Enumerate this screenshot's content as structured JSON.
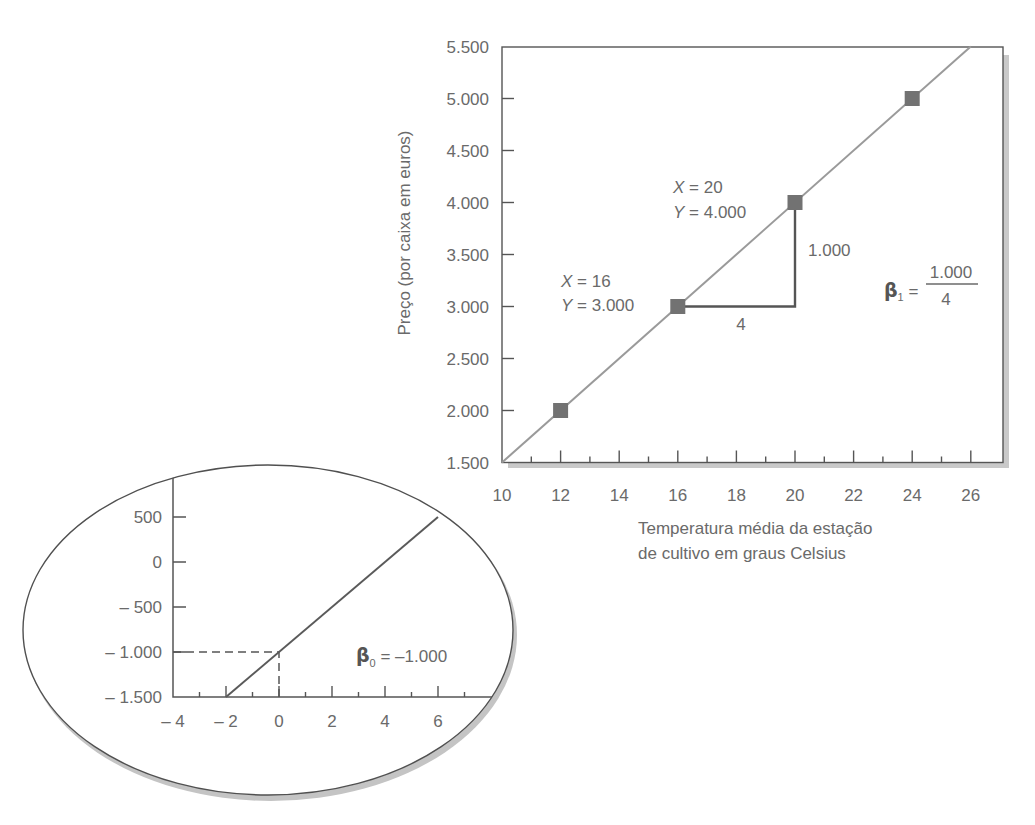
{
  "figure": {
    "main_chart": {
      "y_axis_title": "Preço (por caixa em euros)",
      "x_axis_title": [
        "Temperatura média da estação",
        "de cultivo em graus Celsius"
      ],
      "annotations": {
        "upper_point": {
          "x_var": "X",
          "x_eq": " = 20",
          "y_var": "Y",
          "y_eq": " = 4.000"
        },
        "lower_point": {
          "x_var": "X",
          "x_eq": " = 16",
          "y_var": "Y",
          "y_eq": " = 3.000"
        },
        "rise_label": "1.000",
        "run_label": "4",
        "slope": {
          "symbol": "β",
          "subscript": "1",
          "equals": " = ",
          "numerator": "1.000",
          "denominator": "4"
        }
      }
    },
    "inset_chart": {
      "intercept": {
        "symbol": "β",
        "subscript": "0",
        "equals": " = –1.000"
      }
    }
  },
  "chart_data": [
    {
      "type": "scatter",
      "title": "",
      "xlabel": "Temperatura média da estação de cultivo em graus Celsius",
      "ylabel": "Preço (por caixa em euros)",
      "xlim": [
        10,
        27
      ],
      "ylim": [
        1500,
        5500
      ],
      "grid": false,
      "x_ticks": [
        10,
        12,
        14,
        16,
        18,
        20,
        22,
        24,
        26
      ],
      "x_tick_labels": [
        "10",
        "12",
        "14",
        "16",
        "18",
        "20",
        "22",
        "24",
        "26"
      ],
      "minor_tick_step": 1,
      "y_ticks": [
        1500,
        2000,
        2500,
        3000,
        3500,
        4000,
        4500,
        5000,
        5500
      ],
      "y_tick_labels": [
        "1.500",
        "2.000",
        "2.500",
        "3.000",
        "3.500",
        "4.000",
        "4.500",
        "5.000",
        "5.500"
      ],
      "series": [
        {
          "name": "points",
          "type": "scatter",
          "x": [
            12,
            16,
            20,
            24
          ],
          "y": [
            2000,
            3000,
            4000,
            5000
          ]
        },
        {
          "name": "line",
          "type": "line",
          "x": [
            10,
            26
          ],
          "y": [
            1500,
            5500
          ],
          "equation": "Y = -1000 + 250X"
        }
      ],
      "slope_triangle": {
        "from": [
          16,
          3000
        ],
        "to": [
          20,
          4000
        ],
        "run": 4,
        "rise": 1000
      },
      "annotations": [
        "X = 20, Y = 4.000",
        "X = 16, Y = 3.000",
        "1.000",
        "4",
        "β1 = 1.000 / 4"
      ]
    },
    {
      "type": "line",
      "title": "",
      "xlim": [
        -4,
        7.5
      ],
      "ylim": [
        -1500,
        700
      ],
      "grid": false,
      "x_ticks": [
        -4,
        -2,
        0,
        2,
        4,
        6
      ],
      "x_tick_labels": [
        "– 4",
        "– 2",
        "0",
        "2",
        "4",
        "6"
      ],
      "minor_tick_step": 1,
      "y_ticks": [
        -1500,
        -1000,
        -500,
        0,
        500
      ],
      "y_tick_labels": [
        "– 1.500",
        "– 1.000",
        "– 500",
        "0",
        "500"
      ],
      "series": [
        {
          "name": "line",
          "type": "line",
          "x": [
            -2,
            6
          ],
          "y": [
            -1500,
            500
          ]
        }
      ],
      "reference_lines": [
        {
          "x": 0,
          "y": -1000,
          "style": "dashed"
        }
      ],
      "annotations": [
        "β0 = –1.000"
      ]
    }
  ]
}
